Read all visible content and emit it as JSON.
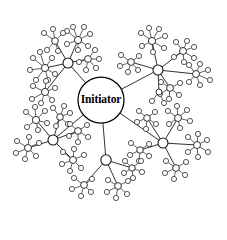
{
  "diagram": {
    "type": "hub-and-spoke-graph",
    "center": {
      "label": "Initiator",
      "x": 101,
      "y": 100,
      "r": 23
    },
    "style": {
      "background": "#ffffff",
      "node_fill": "#ffffff",
      "node_stroke": "#1a1a1a",
      "edge_stroke": "#2b2b2b",
      "label_color": "#000000"
    },
    "counts": {
      "center_nodes": 1,
      "level1_hubs": 5,
      "level2_hubs": 24
    },
    "level1_hubs": [
      {
        "id": "h1",
        "x": 68,
        "y": 63,
        "r": 5.0
      },
      {
        "id": "h2",
        "x": 158,
        "y": 70,
        "r": 5.0
      },
      {
        "id": "h3",
        "x": 53,
        "y": 140,
        "r": 5.0
      },
      {
        "id": "h4",
        "x": 163,
        "y": 143,
        "r": 5.0
      },
      {
        "id": "h5",
        "x": 106,
        "y": 160,
        "r": 5.2
      }
    ],
    "level2_hubs": [
      {
        "parent": "h1",
        "x": 45,
        "y": 68,
        "r": 3.6,
        "leaves": [
          [
            33,
            58
          ],
          [
            30,
            70
          ],
          [
            36,
            80
          ],
          [
            48,
            80
          ],
          [
            55,
            74
          ],
          [
            52,
            58
          ],
          [
            40,
            52
          ]
        ]
      },
      {
        "parent": "h1",
        "x": 45,
        "y": 92,
        "r": 3.6,
        "leaves": [
          [
            33,
            86
          ],
          [
            32,
            99
          ],
          [
            41,
            103
          ],
          [
            52,
            100
          ],
          [
            55,
            88
          ],
          [
            46,
            81
          ]
        ]
      },
      {
        "parent": "h1",
        "x": 78,
        "y": 40,
        "r": 3.6,
        "leaves": [
          [
            67,
            31
          ],
          [
            73,
            27
          ],
          [
            84,
            27
          ],
          [
            90,
            34
          ],
          [
            88,
            46
          ],
          [
            78,
            50
          ],
          [
            67,
            44
          ]
        ]
      },
      {
        "parent": "h1",
        "x": 55,
        "y": 41,
        "r": 3.4,
        "leaves": [
          [
            44,
            33
          ],
          [
            53,
            29
          ],
          [
            63,
            33
          ],
          [
            47,
            50
          ],
          [
            58,
            51
          ]
        ]
      },
      {
        "parent": "h1",
        "x": 88,
        "y": 59,
        "r": 3.4,
        "leaves": [
          [
            95,
            50
          ],
          [
            99,
            59
          ],
          [
            96,
            68
          ],
          [
            86,
            70
          ],
          [
            79,
            62
          ]
        ]
      },
      {
        "parent": "h2",
        "x": 152,
        "y": 41,
        "r": 3.6,
        "leaves": [
          [
            141,
            33
          ],
          [
            149,
            28
          ],
          [
            159,
            29
          ],
          [
            165,
            36
          ],
          [
            164,
            48
          ],
          [
            153,
            52
          ],
          [
            142,
            46
          ]
        ]
      },
      {
        "parent": "h2",
        "x": 183,
        "y": 51,
        "r": 3.5,
        "leaves": [
          [
            176,
            42
          ],
          [
            187,
            41
          ],
          [
            194,
            47
          ],
          [
            194,
            58
          ],
          [
            184,
            62
          ],
          [
            174,
            57
          ]
        ]
      },
      {
        "parent": "h2",
        "x": 131,
        "y": 62,
        "r": 3.4,
        "leaves": [
          [
            121,
            55
          ],
          [
            120,
            66
          ],
          [
            128,
            72
          ],
          [
            138,
            70
          ],
          [
            139,
            56
          ]
        ]
      },
      {
        "parent": "h2",
        "x": 196,
        "y": 74,
        "r": 3.5,
        "leaves": [
          [
            189,
            65
          ],
          [
            200,
            64
          ],
          [
            208,
            70
          ],
          [
            210,
            80
          ],
          [
            200,
            85
          ],
          [
            189,
            82
          ]
        ]
      },
      {
        "parent": "h2",
        "x": 170,
        "y": 88,
        "r": 3.4,
        "leaves": [
          [
            161,
            82
          ],
          [
            160,
            94
          ],
          [
            169,
            99
          ],
          [
            179,
            95
          ],
          [
            180,
            83
          ]
        ]
      },
      {
        "parent": "h2",
        "x": 159,
        "y": 92,
        "r": 3.0,
        "leaves": [
          [
            152,
            101
          ],
          [
            164,
            103
          ]
        ]
      },
      {
        "parent": "h3",
        "x": 36,
        "y": 120,
        "r": 3.6,
        "leaves": [
          [
            26,
            112
          ],
          [
            35,
            107
          ],
          [
            45,
            111
          ],
          [
            47,
            123
          ],
          [
            38,
            130
          ],
          [
            27,
            127
          ]
        ]
      },
      {
        "parent": "h3",
        "x": 28,
        "y": 148,
        "r": 3.5,
        "leaves": [
          [
            17,
            141
          ],
          [
            16,
            153
          ],
          [
            25,
            159
          ],
          [
            36,
            156
          ],
          [
            39,
            143
          ],
          [
            29,
            137
          ]
        ]
      },
      {
        "parent": "h3",
        "x": 60,
        "y": 117,
        "r": 3.3,
        "leaves": [
          [
            53,
            108
          ],
          [
            64,
            106
          ],
          [
            70,
            113
          ],
          [
            68,
            124
          ],
          [
            56,
            126
          ]
        ]
      },
      {
        "parent": "h3",
        "x": 73,
        "y": 160,
        "r": 3.5,
        "leaves": [
          [
            63,
            152
          ],
          [
            62,
            164
          ],
          [
            70,
            171
          ],
          [
            81,
            168
          ],
          [
            84,
            155
          ],
          [
            74,
            149
          ]
        ]
      },
      {
        "parent": "h3",
        "x": 78,
        "y": 131,
        "r": 3.4,
        "leaves": [
          [
            70,
            124
          ],
          [
            69,
            136
          ],
          [
            78,
            142
          ],
          [
            88,
            137
          ],
          [
            87,
            125
          ]
        ]
      },
      {
        "parent": "h4",
        "x": 178,
        "y": 118,
        "r": 3.5,
        "leaves": [
          [
            168,
            111
          ],
          [
            177,
            106
          ],
          [
            187,
            110
          ],
          [
            190,
            121
          ],
          [
            180,
            128
          ],
          [
            169,
            124
          ]
        ]
      },
      {
        "parent": "h4",
        "x": 197,
        "y": 145,
        "r": 3.5,
        "leaves": [
          [
            188,
            137
          ],
          [
            198,
            134
          ],
          [
            207,
            140
          ],
          [
            208,
            152
          ],
          [
            198,
            157
          ],
          [
            188,
            152
          ]
        ]
      },
      {
        "parent": "h4",
        "x": 147,
        "y": 118,
        "r": 3.3,
        "leaves": [
          [
            139,
            111
          ],
          [
            137,
            122
          ],
          [
            146,
            129
          ],
          [
            156,
            124
          ],
          [
            155,
            112
          ]
        ]
      },
      {
        "parent": "h4",
        "x": 176,
        "y": 168,
        "r": 3.4,
        "leaves": [
          [
            166,
            161
          ],
          [
            165,
            173
          ],
          [
            174,
            179
          ],
          [
            185,
            175
          ],
          [
            186,
            162
          ]
        ]
      },
      {
        "parent": "h4",
        "x": 140,
        "y": 150,
        "r": 3.3,
        "leaves": [
          [
            131,
            143
          ],
          [
            130,
            155
          ],
          [
            139,
            161
          ],
          [
            149,
            156
          ],
          [
            149,
            144
          ]
        ]
      },
      {
        "parent": "h5",
        "x": 84,
        "y": 185,
        "r": 3.4,
        "leaves": [
          [
            74,
            178
          ],
          [
            72,
            189
          ],
          [
            81,
            196
          ],
          [
            91,
            192
          ],
          [
            92,
            179
          ]
        ]
      },
      {
        "parent": "h5",
        "x": 118,
        "y": 186,
        "r": 3.4,
        "leaves": [
          [
            108,
            180
          ],
          [
            107,
            192
          ],
          [
            116,
            198
          ],
          [
            127,
            194
          ],
          [
            128,
            181
          ]
        ]
      },
      {
        "parent": "h5",
        "x": 132,
        "y": 168,
        "r": 3.2,
        "leaves": [
          [
            125,
            161
          ],
          [
            124,
            173
          ],
          [
            133,
            178
          ],
          [
            142,
            172
          ],
          [
            141,
            161
          ]
        ]
      }
    ]
  }
}
